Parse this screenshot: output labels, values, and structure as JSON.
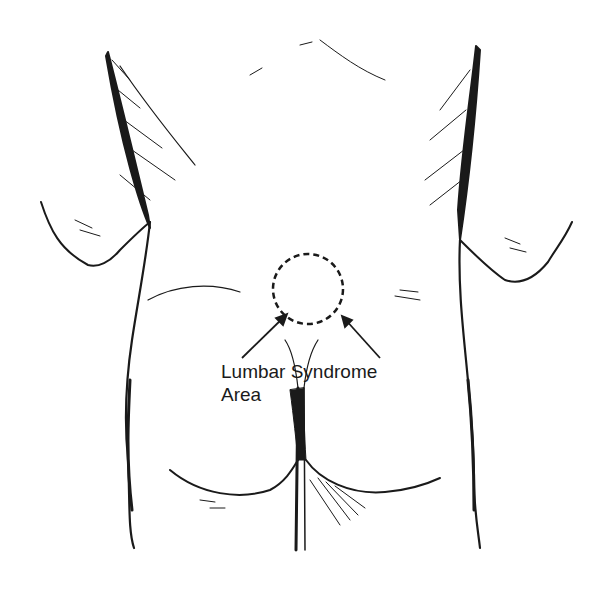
{
  "figure": {
    "label": {
      "line1": "Lumbar Syndrome",
      "line2": "Area"
    },
    "marker": {
      "shape": "dashed-circle",
      "center": [
        308,
        289
      ],
      "radius": 35
    },
    "arrows": [
      {
        "from": [
          242,
          358
        ],
        "to": [
          287,
          314
        ]
      },
      {
        "from": [
          380,
          358
        ],
        "to": [
          342,
          316
        ]
      }
    ],
    "colors": {
      "ink": "#1a1a1a",
      "background": "#ffffff"
    }
  }
}
